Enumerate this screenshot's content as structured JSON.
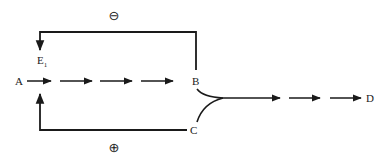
{
  "diagram": {
    "nodes": {
      "A": "A",
      "B": "B",
      "C": "C",
      "D": "D",
      "E1_main": "E",
      "E1_sub": "1"
    },
    "feedback": {
      "negative_symbol": "⊖",
      "positive_symbol": "⊕"
    },
    "edges": [
      {
        "from": "A",
        "to": "B",
        "style": "dashed-arrows",
        "segments": 4
      },
      {
        "from": "B",
        "to": "E1",
        "type": "feedback",
        "sign": "negative"
      },
      {
        "from": "C",
        "to": "E1",
        "type": "feedback",
        "sign": "positive"
      },
      {
        "from": "B+C",
        "to": "D",
        "style": "dashed-arrows",
        "segments": 3
      }
    ],
    "colors": {
      "ink": "#1a1a1a",
      "background": "#ffffff"
    }
  }
}
